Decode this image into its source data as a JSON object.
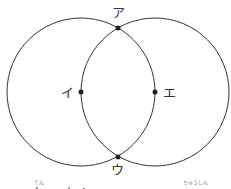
{
  "diagram": {
    "type": "two intersecting circles",
    "circles": [
      {
        "name": "left-circle",
        "cx": 81,
        "cy": 92,
        "r": 74
      },
      {
        "name": "right-circle",
        "cx": 155,
        "cy": 92,
        "r": 74
      }
    ],
    "points": [
      {
        "id": "a",
        "label": "ア",
        "x": 118,
        "y": 28
      },
      {
        "id": "i",
        "label": "イ",
        "x": 81,
        "y": 92
      },
      {
        "id": "u",
        "label": "ウ",
        "x": 118,
        "y": 157
      },
      {
        "id": "e",
        "label": "エ",
        "x": 155,
        "y": 92
      }
    ],
    "stroke_color": "#333333"
  },
  "caption": {
    "furigana_1": "てん",
    "furigana_2": "ちゅうしん",
    "text_partial": "点…中心"
  }
}
